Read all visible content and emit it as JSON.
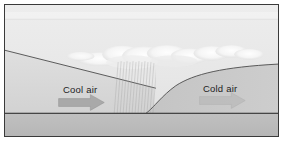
{
  "diagram": {
    "type": "weather-front-cross-section",
    "frame": {
      "border_color": "#3a3a3a",
      "background_color": "#e9e9e9"
    },
    "labels": {
      "cool_air": "Cool air",
      "cold_air": "Cold air"
    },
    "arrows": {
      "cool_air_arrow": {
        "direction": "right",
        "fill": "#a8a8a8",
        "stroke": "#8d8d8d"
      },
      "cold_air_arrow": {
        "direction": "right",
        "fill": "#b9b9b9",
        "stroke": "#ababab"
      }
    },
    "regions": {
      "sky": {
        "name": "sky",
        "fill_top": "#ececec",
        "fill_bottom": "#e2e2e2"
      },
      "sky_band": {
        "name": "upper-sky-band",
        "fill": "#f1f1f1"
      },
      "cool_air_mass": {
        "name": "cool-air-mass",
        "fill": "#dcdcdc"
      },
      "cold_air_mass": {
        "name": "cold-air-dome",
        "fill": "#c9c9c9"
      },
      "ground": {
        "name": "ground-strip",
        "fill": "#bdbdbd",
        "line_color": "#2f2f2f"
      }
    },
    "features": {
      "warm_front_line": {
        "name": "warm-front-boundary",
        "color": "#4a4a4a"
      },
      "cold_front_line": {
        "name": "cold-air-boundary",
        "color": "#4a4a4a"
      },
      "cloud": {
        "name": "cloud-band",
        "fill": "#fbfbfb"
      },
      "precipitation": {
        "name": "precipitation-streaks",
        "color": "#9a9a9a"
      }
    }
  }
}
